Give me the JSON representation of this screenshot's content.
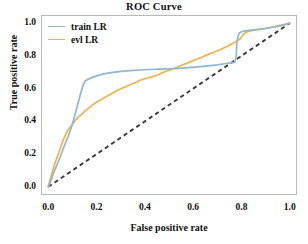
{
  "chart_data": {
    "type": "line",
    "title": "ROC Curve",
    "xlabel": "False positive rate",
    "ylabel": "True positive rate",
    "xlim": [
      -0.03,
      1.03
    ],
    "ylim": [
      -0.05,
      1.05
    ],
    "grid": false,
    "legend_position": "upper left",
    "xticks": [
      "0.0",
      "0.2",
      "0.4",
      "0.6",
      "0.8",
      "1.0"
    ],
    "xtick_values": [
      0.0,
      0.2,
      0.4,
      0.6,
      0.8,
      1.0
    ],
    "yticks": [
      "0.0",
      "0.2",
      "0.4",
      "0.6",
      "0.8",
      "1.0"
    ],
    "ytick_values": [
      0.0,
      0.2,
      0.4,
      0.6,
      0.8,
      1.0
    ],
    "series": [
      {
        "name": "train LR",
        "color": "#8fb6d2",
        "x": [
          0.0,
          0.01,
          0.02,
          0.035,
          0.05,
          0.065,
          0.08,
          0.095,
          0.105,
          0.115,
          0.125,
          0.135,
          0.145,
          0.152,
          0.158,
          0.175,
          0.2,
          0.23,
          0.26,
          0.3,
          0.34,
          0.38,
          0.42,
          0.46,
          0.5,
          0.54,
          0.58,
          0.62,
          0.66,
          0.7,
          0.73,
          0.755,
          0.772,
          0.778,
          0.781,
          0.79,
          0.81,
          0.84,
          0.87,
          0.9,
          0.93,
          0.96,
          0.98,
          1.0
        ],
        "y": [
          0.0,
          0.035,
          0.075,
          0.13,
          0.185,
          0.245,
          0.3,
          0.36,
          0.41,
          0.465,
          0.52,
          0.575,
          0.625,
          0.645,
          0.652,
          0.664,
          0.678,
          0.69,
          0.698,
          0.705,
          0.71,
          0.714,
          0.717,
          0.719,
          0.721,
          0.724,
          0.728,
          0.733,
          0.739,
          0.745,
          0.752,
          0.757,
          0.761,
          0.79,
          0.885,
          0.94,
          0.952,
          0.958,
          0.963,
          0.968,
          0.975,
          0.983,
          0.99,
          1.0
        ]
      },
      {
        "name": "evl LR",
        "color": "#f3b14c",
        "x": [
          0.0,
          0.008,
          0.018,
          0.028,
          0.04,
          0.052,
          0.063,
          0.075,
          0.085,
          0.095,
          0.105,
          0.115,
          0.125,
          0.135,
          0.145,
          0.155,
          0.165,
          0.175,
          0.185,
          0.195,
          0.205,
          0.218,
          0.232,
          0.248,
          0.265,
          0.285,
          0.305,
          0.325,
          0.345,
          0.362,
          0.375,
          0.39,
          0.41,
          0.43,
          0.45,
          0.47,
          0.49,
          0.51,
          0.535,
          0.56,
          0.585,
          0.61,
          0.635,
          0.66,
          0.685,
          0.71,
          0.735,
          0.758,
          0.778,
          0.795,
          0.808,
          0.82,
          0.835,
          0.855,
          0.875,
          0.895,
          0.915,
          0.935,
          0.955,
          0.975,
          0.99,
          1.0
        ],
        "y": [
          0.0,
          0.045,
          0.095,
          0.145,
          0.195,
          0.245,
          0.29,
          0.33,
          0.355,
          0.372,
          0.392,
          0.412,
          0.428,
          0.438,
          0.452,
          0.468,
          0.478,
          0.49,
          0.502,
          0.512,
          0.522,
          0.532,
          0.545,
          0.558,
          0.572,
          0.588,
          0.602,
          0.615,
          0.628,
          0.638,
          0.648,
          0.656,
          0.665,
          0.672,
          0.682,
          0.695,
          0.708,
          0.718,
          0.732,
          0.748,
          0.762,
          0.778,
          0.792,
          0.808,
          0.822,
          0.838,
          0.855,
          0.872,
          0.888,
          0.905,
          0.932,
          0.945,
          0.952,
          0.958,
          0.962,
          0.966,
          0.972,
          0.978,
          0.985,
          0.992,
          0.997,
          1.0
        ]
      }
    ],
    "reference_line": {
      "name": "chance-diagonal",
      "style": "dashed",
      "color": "#3a3a3a",
      "x": [
        0.0,
        1.0
      ],
      "y": [
        0.0,
        1.0
      ]
    }
  },
  "legend": {
    "entries": [
      {
        "label": "train LR",
        "color": "#8fb6d2"
      },
      {
        "label": "evl LR",
        "color": "#f3b14c"
      }
    ]
  },
  "colors": {
    "train": "#8fb6d2",
    "evl": "#f3b14c",
    "diagonal": "#3a3a3a",
    "spine": "#b9b9b9",
    "text": "#111111",
    "background": "#ffffff"
  }
}
